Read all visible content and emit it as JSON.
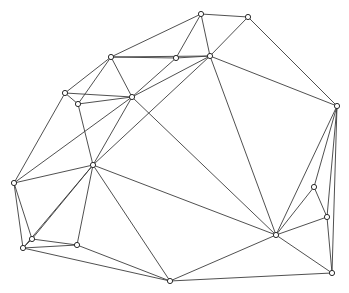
{
  "figure": {
    "title": "",
    "background_color": "#ffffff",
    "width": 349,
    "height": 293
  },
  "graph": {
    "type": "planar-triangulation-graph",
    "edge_color": "#3c3c3c",
    "edge_width": 0.9,
    "node_fill": "#ffffff",
    "node_stroke": "#2b2b2b",
    "node_radius": 2.6,
    "node_count": 20,
    "edge_count": 49,
    "nodes": [
      {
        "id": 0,
        "label": "n0",
        "x": 201,
        "y": 14
      },
      {
        "id": 1,
        "label": "n1",
        "x": 248,
        "y": 17
      },
      {
        "id": 2,
        "label": "n2",
        "x": 111,
        "y": 57
      },
      {
        "id": 3,
        "label": "n3",
        "x": 176,
        "y": 58
      },
      {
        "id": 4,
        "label": "n4",
        "x": 210,
        "y": 56
      },
      {
        "id": 5,
        "label": "n5",
        "x": 65,
        "y": 93
      },
      {
        "id": 6,
        "label": "n6",
        "x": 78,
        "y": 104
      },
      {
        "id": 7,
        "label": "n7",
        "x": 132,
        "y": 97
      },
      {
        "id": 8,
        "label": "n8",
        "x": 337,
        "y": 106
      },
      {
        "id": 9,
        "label": "n9",
        "x": 93,
        "y": 165
      },
      {
        "id": 10,
        "label": "n10",
        "x": 14,
        "y": 183
      },
      {
        "id": 11,
        "label": "n11",
        "x": 314,
        "y": 187
      },
      {
        "id": 12,
        "label": "n12",
        "x": 327,
        "y": 217
      },
      {
        "id": 13,
        "label": "n13",
        "x": 276,
        "y": 235
      },
      {
        "id": 14,
        "label": "n14",
        "x": 32,
        "y": 239
      },
      {
        "id": 15,
        "label": "n15",
        "x": 77,
        "y": 245
      },
      {
        "id": 16,
        "label": "n16",
        "x": 23,
        "y": 248
      },
      {
        "id": 17,
        "label": "n17",
        "x": 332,
        "y": 273
      },
      {
        "id": 18,
        "label": "n18",
        "x": 170,
        "y": 281
      },
      {
        "id": 19,
        "label": "n19",
        "x": 0,
        "y": 0
      }
    ],
    "edges": [
      [
        0,
        1
      ],
      [
        0,
        2
      ],
      [
        0,
        3
      ],
      [
        0,
        4
      ],
      [
        1,
        4
      ],
      [
        1,
        8
      ],
      [
        2,
        3
      ],
      [
        2,
        5
      ],
      [
        2,
        6
      ],
      [
        2,
        7
      ],
      [
        3,
        4
      ],
      [
        3,
        7
      ],
      [
        4,
        7
      ],
      [
        4,
        8
      ],
      [
        4,
        9
      ],
      [
        4,
        13
      ],
      [
        5,
        6
      ],
      [
        5,
        7
      ],
      [
        5,
        10
      ],
      [
        6,
        7
      ],
      [
        6,
        9
      ],
      [
        7,
        9
      ],
      [
        7,
        10
      ],
      [
        7,
        13
      ],
      [
        8,
        11
      ],
      [
        8,
        12
      ],
      [
        8,
        13
      ],
      [
        8,
        17
      ],
      [
        9,
        10
      ],
      [
        9,
        13
      ],
      [
        9,
        14
      ],
      [
        9,
        15
      ],
      [
        9,
        18
      ],
      [
        10,
        14
      ],
      [
        10,
        16
      ],
      [
        11,
        12
      ],
      [
        11,
        13
      ],
      [
        12,
        13
      ],
      [
        12,
        17
      ],
      [
        13,
        17
      ],
      [
        13,
        18
      ],
      [
        14,
        15
      ],
      [
        14,
        16
      ],
      [
        15,
        16
      ],
      [
        15,
        18
      ],
      [
        16,
        18
      ],
      [
        17,
        18
      ],
      [
        9,
        16
      ],
      [
        2,
        4
      ]
    ]
  }
}
